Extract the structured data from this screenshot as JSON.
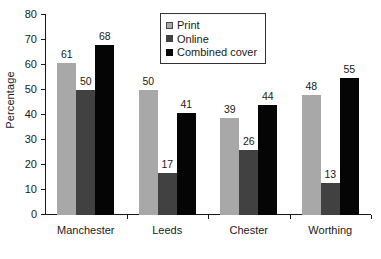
{
  "chart_data": {
    "type": "bar",
    "title": "",
    "subtitle": "",
    "xlabel": "",
    "ylabel": "Percentage",
    "categories": [
      "Manchester",
      "Leeds",
      "Chester",
      "Worthing"
    ],
    "series": [
      {
        "name": "Print",
        "color": "#a8a8a8",
        "values": [
          61,
          50,
          39,
          48
        ]
      },
      {
        "name": "Online",
        "color": "#414141",
        "values": [
          50,
          17,
          26,
          13
        ]
      },
      {
        "name": "Combined cover",
        "color": "#050505",
        "values": [
          68,
          41,
          44,
          55
        ]
      }
    ],
    "ylim": [
      0,
      80
    ],
    "ytick_step": 10,
    "yticks": [
      0,
      10,
      20,
      30,
      40,
      50,
      60,
      70,
      80
    ],
    "ytick_labels": [
      "0",
      "10",
      "20",
      "30",
      "40",
      "50",
      "60",
      "70",
      "80"
    ],
    "grid": false,
    "legend_position": "top-center",
    "data_labels": true,
    "axis_style": "left-and-bottom-spines"
  },
  "legend": {
    "items": [
      {
        "label": "Print",
        "swatch": "print"
      },
      {
        "label": "Online",
        "swatch": "online"
      },
      {
        "label": "Combined cover",
        "swatch": "combined"
      }
    ]
  }
}
